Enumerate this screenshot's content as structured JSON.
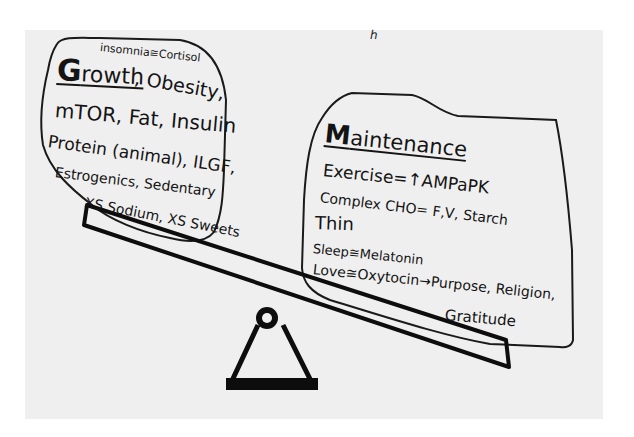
{
  "colors": {
    "page_background": "#ffffff",
    "paper": "#efefef",
    "ink": "#141414"
  },
  "corner_mark": "ℎ",
  "growth": {
    "title_initial": "G",
    "title_rest": "rowth",
    "note_top": "insomnia≅Cortisol",
    "lines": [
      ", Obesity,",
      "mTOR, Fat, Insulin",
      "Protein (animal), ILGF,",
      "Estrogenics, Sedentary",
      "XS Sodium, XS Sweets"
    ]
  },
  "maintenance": {
    "title_initial": "M",
    "title_rest": "aintenance",
    "lines": [
      "Exercise=↑AMPaPK",
      "Complex CHO= F,V, Starch",
      "Thin",
      "Sleep≅Melatonin",
      "Love≅Oxytocin→Purpose, Religion,",
      "Gratitude"
    ]
  },
  "seesaw": {
    "beam": "plank",
    "fulcrum": "triangle-with-pivot"
  }
}
